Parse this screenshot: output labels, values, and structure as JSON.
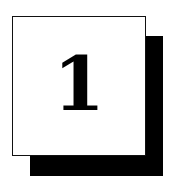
{
  "badge": {
    "number": "1",
    "colors": {
      "card": "#ffffff",
      "shadow": "#000000",
      "text": "#000000"
    }
  }
}
